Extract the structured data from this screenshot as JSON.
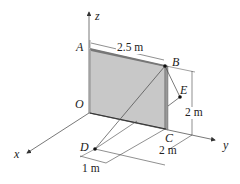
{
  "diagram": {
    "type": "3D statics diagram",
    "axes": {
      "x": "x",
      "y": "y",
      "z": "z"
    },
    "points": {
      "A": "A",
      "B": "B",
      "C": "C",
      "D": "D",
      "E": "E",
      "O": "O"
    },
    "dimensions": {
      "width_AB": "2.5 m",
      "height_BC": "2 m",
      "offset_C_y": "2 m",
      "offset_D_x": "1 m"
    },
    "colors": {
      "panel_fill": "#c8c8c8",
      "panel_edge": "#555555",
      "line": "#444444",
      "point": "#111111"
    }
  }
}
